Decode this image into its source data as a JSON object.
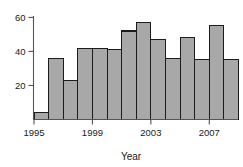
{
  "chart_data": {
    "type": "bar",
    "title": "",
    "subtitle": "",
    "xlabel": "Year",
    "ylabel": "",
    "categories": [
      1995,
      1996,
      1997,
      1998,
      1999,
      2000,
      2001,
      2002,
      2003,
      2004,
      2005,
      2006,
      2007,
      2008
    ],
    "values": [
      4,
      36,
      23,
      42,
      42,
      41,
      52,
      57,
      47,
      36,
      48,
      35,
      55,
      35
    ],
    "x_tick_labels": [
      "1995",
      "1999",
      "2003",
      "2007"
    ],
    "x_tick_values": [
      1995,
      1999,
      2003,
      2007
    ],
    "y_tick_labels": [
      "20",
      "40",
      "60"
    ],
    "y_tick_values": [
      20,
      40,
      60
    ],
    "ylim": [
      0,
      62
    ],
    "xlim": [
      1994.5,
      2009.5
    ],
    "grid": false,
    "legend": null,
    "bar_color": "#a8a8a8",
    "bar_edge_color": "#1c1c1c",
    "axis_color": "#555555",
    "text_color": "#1a1a1a",
    "background": "#ffffff"
  },
  "axis": {
    "x_title": "Year"
  }
}
